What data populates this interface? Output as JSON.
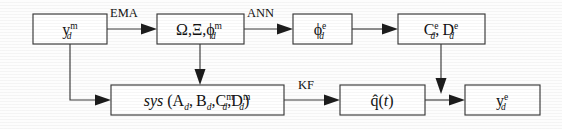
{
  "diagram": {
    "type": "block-diagram",
    "title": "",
    "background_color": "#fdfdfd",
    "line_color": "#3a3a3a",
    "text_color": "#111111",
    "nodes": [
      {
        "id": "node-ym",
        "name": "measured-output-node",
        "shape": "rectangle",
        "row": "top",
        "base": "y",
        "superscript": "m",
        "subscript": "d",
        "plain_text": "y_d^m",
        "x": 33,
        "y": 14,
        "w": 74,
        "h": 30
      },
      {
        "id": "node-omega-xi-phi",
        "name": "modal-parameters-node",
        "shape": "rectangle",
        "row": "top",
        "base": "Ω,Ξ,ϕ",
        "superscript": "m",
        "subscript": "d",
        "plain_text": "Ω,Ξ,ϕ_d^m",
        "x": 157,
        "y": 14,
        "w": 87,
        "h": 30
      },
      {
        "id": "node-phi-e",
        "name": "estimated-mode-shape-node",
        "shape": "rectangle",
        "row": "top",
        "base": "ϕ",
        "superscript": "e",
        "subscript": "d",
        "plain_text": "ϕ_d^e",
        "x": 293,
        "y": 14,
        "w": 59,
        "h": 30
      },
      {
        "id": "node-cd-dd",
        "name": "estimated-output-matrices-node",
        "shape": "rectangle",
        "row": "top",
        "base": "C",
        "superscript": "e",
        "subscript": "d",
        "base2": "D",
        "superscript2": "e",
        "subscript2": "d",
        "plain_text": "C_d^e, D_d^e",
        "x": 398,
        "y": 14,
        "w": 87,
        "h": 30
      },
      {
        "id": "node-sys",
        "name": "state-space-system-node",
        "shape": "rectangle",
        "row": "bottom",
        "prefix_italic": "sys",
        "plain_text": "sys (A_d, B_d, C_d^m, D_d^m)",
        "x": 111,
        "y": 85,
        "w": 173,
        "h": 30
      },
      {
        "id": "node-qhat",
        "name": "estimated-state-node",
        "shape": "rectangle",
        "row": "bottom",
        "base": "q̂(t)",
        "plain_text": "q̂(t)",
        "x": 340,
        "y": 85,
        "w": 85,
        "h": 30
      },
      {
        "id": "node-ye",
        "name": "estimated-output-node",
        "shape": "rectangle",
        "row": "bottom",
        "base": "y",
        "superscript": "e",
        "subscript": "d",
        "plain_text": "y_d^e",
        "x": 465,
        "y": 85,
        "w": 75,
        "h": 30
      }
    ],
    "edges": [
      {
        "id": "edge-ema",
        "name": "edge-ema",
        "from": "node-ym",
        "to": "node-omega-xi-phi",
        "label": "EMA",
        "label_x": 110,
        "label_y": 16,
        "orientation": "horizontal"
      },
      {
        "id": "edge-ann",
        "name": "edge-ann",
        "from": "node-omega-xi-phi",
        "to": "node-phi-e",
        "label": "ANN",
        "label_x": 247,
        "label_y": 16,
        "orientation": "horizontal"
      },
      {
        "id": "edge-phi-to-cd",
        "name": "edge-phi-to-matrices",
        "from": "node-phi-e",
        "to": "node-cd-dd",
        "label": "",
        "orientation": "horizontal"
      },
      {
        "id": "edge-ym-to-sys",
        "name": "edge-measured-to-system",
        "from": "node-ym",
        "to": "node-sys",
        "label": "",
        "orientation": "down-right"
      },
      {
        "id": "edge-modal-to-sys",
        "name": "edge-modal-to-system",
        "from": "node-omega-xi-phi",
        "to": "node-sys",
        "label": "",
        "orientation": "vertical"
      },
      {
        "id": "edge-kf",
        "name": "edge-kalman-filter",
        "from": "node-sys",
        "to": "node-qhat",
        "label": "KF",
        "label_x": 298,
        "label_y": 87,
        "orientation": "horizontal"
      },
      {
        "id": "edge-qhat-to-ye",
        "name": "edge-state-to-output",
        "from": "node-qhat",
        "to": "node-ye",
        "label": "",
        "orientation": "horizontal"
      },
      {
        "id": "edge-cd-to-ye",
        "name": "edge-matrices-to-output",
        "from": "node-cd-dd",
        "to": "node-ye",
        "label": "",
        "orientation": "vertical"
      }
    ]
  }
}
